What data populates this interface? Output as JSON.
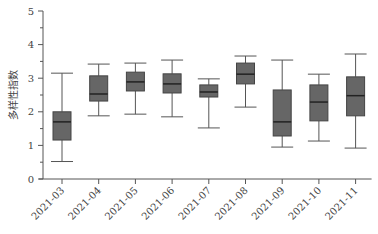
{
  "chart_data": {
    "type": "boxplot",
    "title": "",
    "xlabel": "",
    "ylabel": "多样性指数",
    "ylim": [
      0,
      5
    ],
    "yticks": [
      0,
      1,
      2,
      3,
      4,
      5
    ],
    "grid": false,
    "box_color": "#666666",
    "categories": [
      "2021-03",
      "2021-04",
      "2021-05",
      "2021-06",
      "2021-07",
      "2021-08",
      "2021-09",
      "2021-10",
      "2021-11"
    ],
    "boxes": [
      {
        "min": 0.52,
        "q1": 1.16,
        "median": 1.7,
        "q3": 2.0,
        "max": 3.15
      },
      {
        "min": 1.88,
        "q1": 2.32,
        "median": 2.53,
        "q3": 3.07,
        "max": 3.42
      },
      {
        "min": 1.93,
        "q1": 2.62,
        "median": 2.89,
        "q3": 3.18,
        "max": 3.45
      },
      {
        "min": 1.85,
        "q1": 2.56,
        "median": 2.83,
        "q3": 3.13,
        "max": 3.54
      },
      {
        "min": 1.52,
        "q1": 2.44,
        "median": 2.59,
        "q3": 2.8,
        "max": 2.98
      },
      {
        "min": 2.14,
        "q1": 2.83,
        "median": 3.12,
        "q3": 3.45,
        "max": 3.66
      },
      {
        "min": 0.95,
        "q1": 1.28,
        "median": 1.7,
        "q3": 2.65,
        "max": 3.54
      },
      {
        "min": 1.13,
        "q1": 1.73,
        "median": 2.29,
        "q3": 2.8,
        "max": 3.12
      },
      {
        "min": 0.92,
        "q1": 1.88,
        "median": 2.48,
        "q3": 3.04,
        "max": 3.72
      }
    ]
  }
}
